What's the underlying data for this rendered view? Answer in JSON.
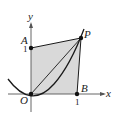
{
  "figure": {
    "axes": {
      "x_label": "x",
      "y_label": "y"
    },
    "points": {
      "origin": "O",
      "a": "A",
      "b": "B",
      "p": "P"
    },
    "ticks": {
      "x_tick": "1",
      "y_tick": "1"
    },
    "colors": {
      "shade": "#d9d9d9",
      "stroke": "#1a1a1a"
    }
  }
}
